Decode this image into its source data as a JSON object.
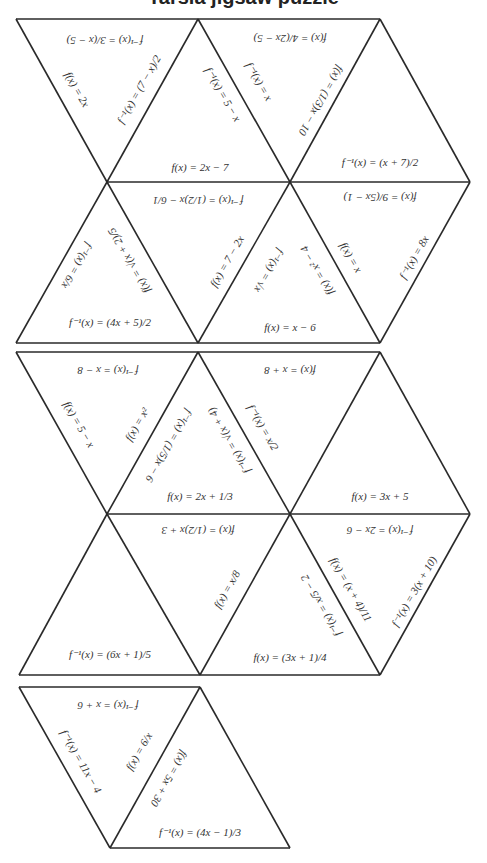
{
  "title": "Tarsia jigsaw puzzle",
  "pieces": [
    {
      "name": "piece-1",
      "triangles": 7
    },
    {
      "name": "piece-2",
      "triangles": 6
    },
    {
      "name": "piece-3",
      "triangles": 2
    }
  ],
  "labels": [
    {
      "id": "l1",
      "text": "f⁻¹(x) = 3/(x − 5)",
      "x": 105,
      "y": 40,
      "rot": 180
    },
    {
      "id": "l2",
      "text": "f(x) = 2x",
      "x": 76,
      "y": 90,
      "rot": 60
    },
    {
      "id": "l3",
      "text": "f⁻¹(x) = (7 − x)/2",
      "x": 140,
      "y": 90,
      "rot": -60
    },
    {
      "id": "l4",
      "text": "f(x) = 4/(2x − 5)",
      "x": 290,
      "y": 38,
      "rot": 180
    },
    {
      "id": "l5",
      "text": "f⁻¹(x) = 5 − x",
      "x": 222,
      "y": 95,
      "rot": 60
    },
    {
      "id": "l6",
      "text": "f⁻¹(x) = x",
      "x": 258,
      "y": 82,
      "rot": 60
    },
    {
      "id": "l7",
      "text": "f(x) = (1/3)x − 10",
      "x": 320,
      "y": 100,
      "rot": 120
    },
    {
      "id": "l8",
      "text": "f(x) = 2x − 7",
      "x": 200,
      "y": 168,
      "rot": 0
    },
    {
      "id": "l9",
      "text": "f⁻¹(x) = (x + 7)/2",
      "x": 380,
      "y": 163,
      "rot": 0
    },
    {
      "id": "l10",
      "text": "f⁻¹(x) = (1/2)x − 6/1",
      "x": 198,
      "y": 200,
      "rot": 180
    },
    {
      "id": "l11",
      "text": "f(x) = 9/(5x − 1)",
      "x": 380,
      "y": 197,
      "rot": 180
    },
    {
      "id": "l12",
      "text": "f⁻¹(x) = 6/x",
      "x": 76,
      "y": 265,
      "rot": 120
    },
    {
      "id": "l13",
      "text": "f(x) = √(x + 2)/5",
      "x": 130,
      "y": 260,
      "rot": 240
    },
    {
      "id": "l14",
      "text": "f(x) = 7 − 2x",
      "x": 228,
      "y": 262,
      "rot": -60
    },
    {
      "id": "l15",
      "text": "f⁻¹(x) = √x",
      "x": 268,
      "y": 270,
      "rot": 120
    },
    {
      "id": "l16",
      "text": "f(x) = x² − 4",
      "x": 318,
      "y": 270,
      "rot": 240
    },
    {
      "id": "l17",
      "text": "f(x) = x",
      "x": 350,
      "y": 258,
      "rot": 60
    },
    {
      "id": "l18",
      "text": "f⁻¹(x) = 8x",
      "x": 415,
      "y": 258,
      "rot": -60
    },
    {
      "id": "l19",
      "text": "f⁻¹(x) = (4x + 5)/2",
      "x": 110,
      "y": 323,
      "rot": 0
    },
    {
      "id": "l20",
      "text": "f(x) = x − 6",
      "x": 290,
      "y": 328,
      "rot": 0
    },
    {
      "id": "l21",
      "text": "f⁻¹(x) = x − 8",
      "x": 108,
      "y": 370,
      "rot": 180
    },
    {
      "id": "l22",
      "text": "f(x) = x + 8",
      "x": 290,
      "y": 370,
      "rot": 180
    },
    {
      "id": "l23",
      "text": "f(x) = 5 − x",
      "x": 78,
      "y": 425,
      "rot": 60
    },
    {
      "id": "l24",
      "text": "f(x) = x²",
      "x": 138,
      "y": 425,
      "rot": -60
    },
    {
      "id": "l25",
      "text": "f⁻¹(x) = (1/5)x − 6",
      "x": 168,
      "y": 445,
      "rot": 120
    },
    {
      "id": "l26",
      "text": "f⁻¹(x) = √(x + 4)",
      "x": 230,
      "y": 440,
      "rot": 240
    },
    {
      "id": "l27",
      "text": "f⁻¹(x) = x/2",
      "x": 262,
      "y": 428,
      "rot": 60
    },
    {
      "id": "l28",
      "text": "f(x) = 2x + 1/3",
      "x": 200,
      "y": 497,
      "rot": 0
    },
    {
      "id": "l29",
      "text": "f(x) = 3x + 5",
      "x": 380,
      "y": 497,
      "rot": 0
    },
    {
      "id": "l30",
      "text": "f(x) = (1/2)x + 3",
      "x": 198,
      "y": 530,
      "rot": 180
    },
    {
      "id": "l31",
      "text": "f⁻¹(x) = 2x − 6",
      "x": 380,
      "y": 530,
      "rot": 180
    },
    {
      "id": "l32",
      "text": "f(x) = x/8",
      "x": 228,
      "y": 590,
      "rot": -60
    },
    {
      "id": "l33",
      "text": "f⁻¹(x) = x/5 − 2",
      "x": 322,
      "y": 605,
      "rot": 240
    },
    {
      "id": "l34",
      "text": "f(x) = (x + 4)/11",
      "x": 350,
      "y": 590,
      "rot": 60
    },
    {
      "id": "l35",
      "text": "f⁻¹(x) = 3(x + 10)",
      "x": 415,
      "y": 592,
      "rot": -60
    },
    {
      "id": "l36",
      "text": "f⁻¹(x) = (6x + 1)/5",
      "x": 110,
      "y": 655,
      "rot": 0
    },
    {
      "id": "l37",
      "text": "f(x) = (3x + 1)/4",
      "x": 290,
      "y": 658,
      "rot": 0
    },
    {
      "id": "l38",
      "text": "f⁻¹(x) = x + 6",
      "x": 108,
      "y": 705,
      "rot": 180
    },
    {
      "id": "l39",
      "text": "f⁻¹(x) = 11x − 4",
      "x": 80,
      "y": 762,
      "rot": 60
    },
    {
      "id": "l40",
      "text": "f(x) = 6/x",
      "x": 140,
      "y": 752,
      "rot": -60
    },
    {
      "id": "l41",
      "text": "f(x) = 5x + 30",
      "x": 168,
      "y": 778,
      "rot": 120
    },
    {
      "id": "l42",
      "text": "f⁻¹(x) = (4x − 1)/3",
      "x": 200,
      "y": 833,
      "rot": 0
    }
  ]
}
